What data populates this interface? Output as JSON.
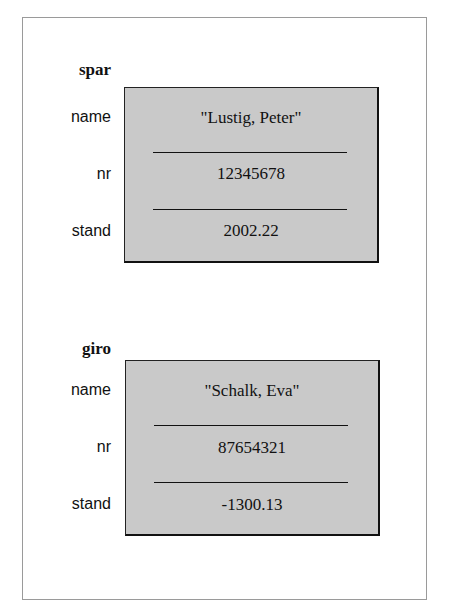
{
  "objects": [
    {
      "name": "spar",
      "fields": [
        {
          "label": "name",
          "value": "\"Lustig, Peter\""
        },
        {
          "label": "nr",
          "value": "12345678"
        },
        {
          "label": "stand",
          "value": "2002.22"
        }
      ]
    },
    {
      "name": "giro",
      "fields": [
        {
          "label": "name",
          "value": "\"Schalk, Eva\""
        },
        {
          "label": "nr",
          "value": "87654321"
        },
        {
          "label": "stand",
          "value": "-1300.13"
        }
      ]
    }
  ],
  "colors": {
    "box_fill": "#c9c9c9",
    "border": "#111111",
    "frame": "#9a9a9a"
  }
}
